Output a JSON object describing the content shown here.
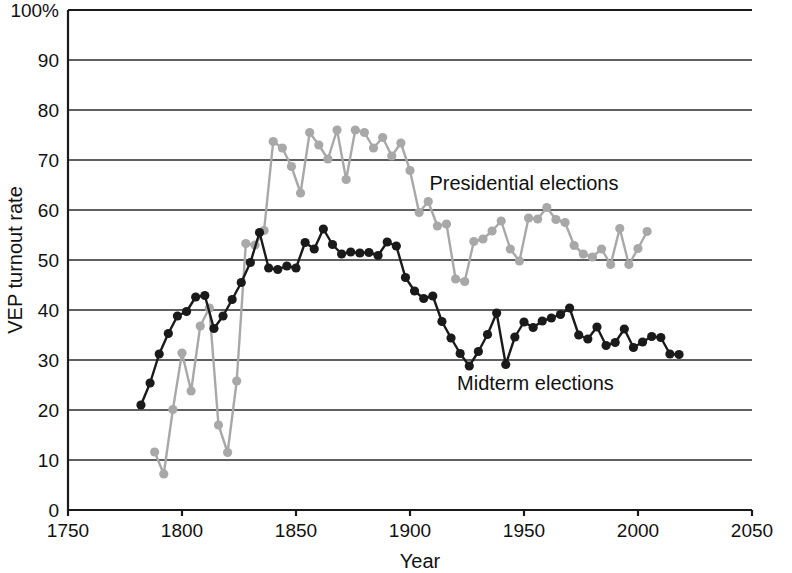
{
  "chart_data": {
    "type": "line",
    "title": "",
    "xlabel": "Year",
    "ylabel": "VEP turnout rate",
    "xlim": [
      1750,
      2050
    ],
    "ylim": [
      0,
      100
    ],
    "xticks": [
      1750,
      1800,
      1850,
      1900,
      1950,
      2000,
      2050
    ],
    "xtick_labels": [
      "1750",
      "1800",
      "1850",
      "1900",
      "1950",
      "2000",
      "2050"
    ],
    "yticks": [
      0,
      10,
      20,
      30,
      40,
      50,
      60,
      70,
      80,
      90,
      100
    ],
    "ytick_labels": [
      "0",
      "10",
      "20",
      "30",
      "40",
      "50",
      "60",
      "70",
      "80",
      "90",
      "100%"
    ],
    "grid": "horizontal",
    "legend_position": "inline-annotation",
    "markers": "circle",
    "series": [
      {
        "name": "Presidential elections",
        "color": "#a8a8a8",
        "annotation": "Presidential elections",
        "annotation_x": 1950,
        "annotation_y": 64,
        "points": [
          [
            1788,
            11.6
          ],
          [
            1792,
            7.2
          ],
          [
            1796,
            20.1
          ],
          [
            1800,
            31.4
          ],
          [
            1804,
            23.8
          ],
          [
            1808,
            36.8
          ],
          [
            1812,
            40.4
          ],
          [
            1816,
            17.0
          ],
          [
            1820,
            11.5
          ],
          [
            1824,
            25.8
          ],
          [
            1828,
            53.3
          ],
          [
            1832,
            53.0
          ],
          [
            1836,
            55.9
          ],
          [
            1840,
            73.7
          ],
          [
            1844,
            72.4
          ],
          [
            1848,
            68.7
          ],
          [
            1852,
            63.4
          ],
          [
            1856,
            75.5
          ],
          [
            1860,
            73.0
          ],
          [
            1864,
            70.2
          ],
          [
            1868,
            76.0
          ],
          [
            1872,
            66.1
          ],
          [
            1876,
            76.0
          ],
          [
            1880,
            75.5
          ],
          [
            1884,
            72.4
          ],
          [
            1888,
            74.5
          ],
          [
            1892,
            70.8
          ],
          [
            1896,
            73.4
          ],
          [
            1900,
            67.9
          ],
          [
            1904,
            59.5
          ],
          [
            1908,
            61.7
          ],
          [
            1912,
            56.8
          ],
          [
            1916,
            57.2
          ],
          [
            1920,
            46.2
          ],
          [
            1924,
            45.7
          ],
          [
            1928,
            53.7
          ],
          [
            1932,
            54.2
          ],
          [
            1936,
            55.8
          ],
          [
            1940,
            57.8
          ],
          [
            1944,
            52.2
          ],
          [
            1948,
            49.8
          ],
          [
            1952,
            58.4
          ],
          [
            1956,
            58.2
          ],
          [
            1960,
            60.5
          ],
          [
            1964,
            58.1
          ],
          [
            1968,
            57.5
          ],
          [
            1972,
            52.9
          ],
          [
            1976,
            51.2
          ],
          [
            1980,
            50.6
          ],
          [
            1984,
            52.2
          ],
          [
            1988,
            49.1
          ],
          [
            1992,
            56.3
          ],
          [
            1996,
            49.1
          ],
          [
            2000,
            52.3
          ],
          [
            2004,
            55.7
          ]
        ]
      },
      {
        "name": "Midterm elections",
        "color": "#1a1a1a",
        "annotation": "Midterm elections",
        "annotation_x": 1955,
        "annotation_y": 24,
        "points": [
          [
            1782,
            21.0
          ],
          [
            1786,
            25.4
          ],
          [
            1790,
            31.2
          ],
          [
            1794,
            35.3
          ],
          [
            1798,
            38.8
          ],
          [
            1802,
            39.7
          ],
          [
            1806,
            42.6
          ],
          [
            1810,
            42.9
          ],
          [
            1814,
            36.3
          ],
          [
            1818,
            38.8
          ],
          [
            1822,
            42.1
          ],
          [
            1826,
            45.5
          ],
          [
            1830,
            49.5
          ],
          [
            1834,
            55.5
          ],
          [
            1838,
            48.4
          ],
          [
            1842,
            48.1
          ],
          [
            1846,
            48.8
          ],
          [
            1850,
            48.4
          ],
          [
            1854,
            53.5
          ],
          [
            1858,
            52.2
          ],
          [
            1862,
            56.2
          ],
          [
            1866,
            53.1
          ],
          [
            1870,
            51.2
          ],
          [
            1874,
            51.6
          ],
          [
            1878,
            51.4
          ],
          [
            1882,
            51.5
          ],
          [
            1886,
            50.9
          ],
          [
            1890,
            53.6
          ],
          [
            1894,
            52.8
          ],
          [
            1898,
            46.5
          ],
          [
            1902,
            43.8
          ],
          [
            1906,
            42.3
          ],
          [
            1910,
            42.8
          ],
          [
            1914,
            37.7
          ],
          [
            1918,
            34.4
          ],
          [
            1922,
            31.3
          ],
          [
            1926,
            28.8
          ],
          [
            1930,
            31.7
          ],
          [
            1934,
            35.1
          ],
          [
            1938,
            39.4
          ],
          [
            1942,
            29.1
          ],
          [
            1946,
            34.6
          ],
          [
            1950,
            37.6
          ],
          [
            1954,
            36.5
          ],
          [
            1958,
            37.8
          ],
          [
            1962,
            38.4
          ],
          [
            1966,
            39.1
          ],
          [
            1970,
            40.4
          ],
          [
            1974,
            35.0
          ],
          [
            1978,
            34.2
          ],
          [
            1982,
            36.6
          ],
          [
            1986,
            32.9
          ],
          [
            1990,
            33.5
          ],
          [
            1994,
            36.2
          ],
          [
            1998,
            32.5
          ],
          [
            2002,
            33.6
          ],
          [
            2006,
            34.7
          ],
          [
            2010,
            34.5
          ],
          [
            2014,
            31.2
          ],
          [
            2018,
            31.1
          ]
        ]
      }
    ]
  },
  "axes": {
    "x_axis_title": "Year",
    "y_axis_title": "VEP turnout rate"
  }
}
